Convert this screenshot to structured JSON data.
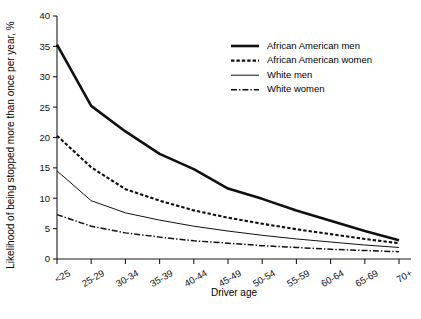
{
  "chart_data": {
    "type": "line",
    "title": "",
    "xlabel": "Driver age",
    "ylabel": "Likelihood of being stopped more than once per year, %",
    "categories": [
      "<25",
      "25-29",
      "30-34",
      "35-39",
      "40-44",
      "45-49",
      "50-54",
      "55-59",
      "60-64",
      "65-69",
      "70+"
    ],
    "ylim": [
      0,
      40
    ],
    "yticks": [
      0,
      5,
      10,
      15,
      20,
      25,
      30,
      35,
      40
    ],
    "grid": false,
    "legend_position": "top-right",
    "series": [
      {
        "name": "African American men",
        "style": "solid-thick",
        "values": [
          35.3,
          25.2,
          21.0,
          17.3,
          14.8,
          11.6,
          9.9,
          8.0,
          6.3,
          4.6,
          3.1
        ]
      },
      {
        "name": "African American women",
        "style": "dashed",
        "values": [
          20.3,
          15.1,
          11.5,
          9.6,
          8.0,
          6.8,
          5.8,
          4.9,
          4.1,
          3.3,
          2.6
        ]
      },
      {
        "name": "White men",
        "style": "solid-thin",
        "values": [
          14.5,
          9.6,
          7.6,
          6.4,
          5.4,
          4.6,
          3.9,
          3.3,
          2.8,
          2.3,
          1.9
        ]
      },
      {
        "name": "White women",
        "style": "dash-dot",
        "values": [
          7.3,
          5.4,
          4.3,
          3.6,
          3.0,
          2.6,
          2.2,
          1.9,
          1.6,
          1.4,
          1.2
        ]
      }
    ]
  }
}
